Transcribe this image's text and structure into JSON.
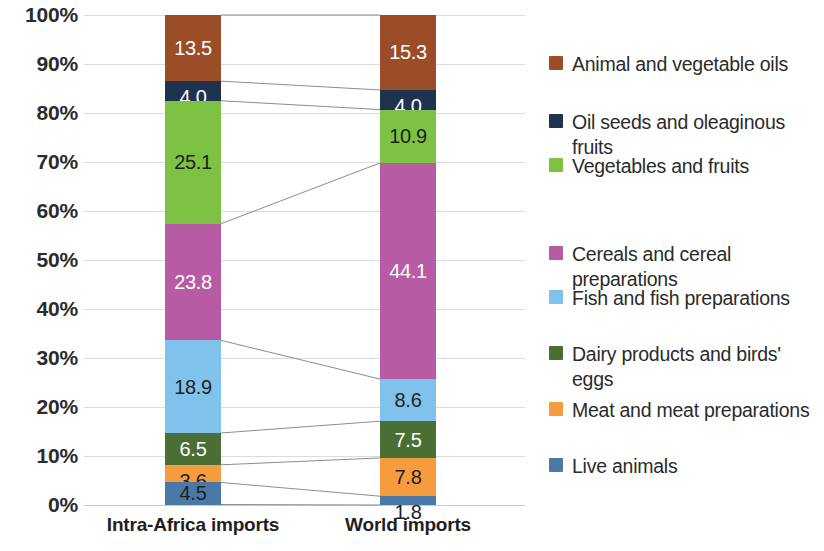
{
  "chart_data": {
    "type": "bar",
    "subtype": "100% stacked column",
    "title": "",
    "subtitle": "",
    "xlabel": "",
    "ylabel": "",
    "categories": [
      "Intra-Africa imports",
      "World imports"
    ],
    "ylim": [
      0,
      100
    ],
    "ytick_labels": [
      "0%",
      "10%",
      "20%",
      "30%",
      "40%",
      "50%",
      "60%",
      "70%",
      "80%",
      "90%",
      "100%"
    ],
    "ytick_values": [
      0,
      10,
      20,
      30,
      40,
      50,
      60,
      70,
      80,
      90,
      100
    ],
    "grid": true,
    "legend_position": "right",
    "connectors": true,
    "stack_order_top_to_bottom": [
      "Animal and vegetable oils",
      "Oil seeds and oleaginous fruits",
      "Vegetables and fruits",
      "Cereals and cereal preparations",
      "Fish and fish preparations",
      "Dairy products and birds' eggs",
      "Meat and meat preparations",
      "Live animals"
    ],
    "series": [
      {
        "name": "Animal and vegetable oils",
        "color": "#9a4d26",
        "label_color": "light",
        "values": [
          13.5,
          15.3
        ],
        "labels": [
          "13.5",
          "15.3"
        ]
      },
      {
        "name": "Oil seeds and oleaginous fruits",
        "color": "#1f3350",
        "label_color": "light",
        "values": [
          4.0,
          4.0
        ],
        "labels": [
          "4.0",
          "4.0"
        ]
      },
      {
        "name": "Vegetables and fruits",
        "color": "#7dc242",
        "label_color": "dark",
        "values": [
          25.1,
          10.9
        ],
        "labels": [
          "25.1",
          "10.9"
        ]
      },
      {
        "name": "Cereals and cereal preparations",
        "color": "#b85ba5",
        "label_color": "light",
        "values": [
          23.8,
          44.1
        ],
        "labels": [
          "23.8",
          "44.1"
        ]
      },
      {
        "name": "Fish and fish preparations",
        "color": "#7fc3ed",
        "label_color": "dark",
        "values": [
          18.9,
          8.6
        ],
        "labels": [
          "18.9",
          "8.6"
        ]
      },
      {
        "name": "Dairy products and birds' eggs",
        "color": "#4a6e33",
        "label_color": "light",
        "values": [
          6.5,
          7.5
        ],
        "labels": [
          "6.5",
          "7.5"
        ]
      },
      {
        "name": "Meat and meat preparations",
        "color": "#f79b3f",
        "label_color": "dark",
        "values": [
          3.6,
          7.8
        ],
        "labels": [
          "3.6",
          "7.8"
        ]
      },
      {
        "name": "Live animals",
        "color": "#4a79a8",
        "label_color": "dark",
        "values": [
          4.5,
          1.8
        ],
        "labels": [
          "4.5",
          "1.8"
        ]
      }
    ]
  },
  "axis": {
    "y_ticks": [
      {
        "label": "100%",
        "value": 100
      },
      {
        "label": "90%",
        "value": 90
      },
      {
        "label": "80%",
        "value": 80
      },
      {
        "label": "70%",
        "value": 70
      },
      {
        "label": "60%",
        "value": 60
      },
      {
        "label": "50%",
        "value": 50
      },
      {
        "label": "40%",
        "value": 40
      },
      {
        "label": "30%",
        "value": 30
      },
      {
        "label": "20%",
        "value": 20
      },
      {
        "label": "10%",
        "value": 10
      },
      {
        "label": "0%",
        "value": 0
      }
    ],
    "x_labels": [
      "Intra-Africa imports",
      "World imports"
    ]
  },
  "legend": {
    "items": [
      {
        "label": "Animal and vegetable oils",
        "color": "#9a4d26"
      },
      {
        "label": "Oil seeds and oleaginous fruits",
        "color": "#1f3350"
      },
      {
        "label": "Vegetables and fruits",
        "color": "#7dc242"
      },
      {
        "label": "Cereals and cereal preparations",
        "color": "#b85ba5"
      },
      {
        "label": "Fish and fish preparations",
        "color": "#7fc3ed"
      },
      {
        "label": "Dairy products and birds' eggs",
        "color": "#4a6e33"
      },
      {
        "label": "Meat and meat preparations",
        "color": "#f79b3f"
      },
      {
        "label": "Live animals",
        "color": "#4a79a8"
      }
    ]
  },
  "style": {
    "gridline_color": "#d9dde3",
    "connector_color": "#8d8d8d",
    "background": "#ffffff",
    "text_color": "#2b2b2b"
  }
}
